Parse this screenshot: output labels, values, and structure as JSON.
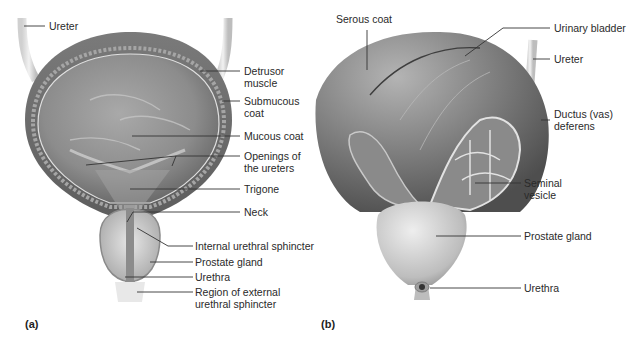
{
  "figure": {
    "panel_a": {
      "panel_label": "(a)",
      "labels": {
        "ureter": "Ureter",
        "detrusor_muscle": "Detrusor\nmuscle",
        "submucous_coat": "Submucous\ncoat",
        "mucous_coat": "Mucous coat",
        "openings_of_ureters": "Openings of\nthe ureters",
        "trigone": "Trigone",
        "neck": "Neck",
        "internal_urethral_sphincter": "Internal urethral sphincter",
        "prostate_gland": "Prostate gland",
        "urethra": "Urethra",
        "region_external_sphincter": "Region of external\nurethral sphincter"
      }
    },
    "panel_b": {
      "panel_label": "(b)",
      "labels": {
        "serous_coat": "Serous coat",
        "urinary_bladder": "Urinary bladder",
        "ureter": "Ureter",
        "ductus_deferens": "Ductus (vas)\ndeferens",
        "seminal_vesicle": "Seminal\nvesicle",
        "prostate_gland": "Prostate gland",
        "urethra": "Urethra"
      }
    },
    "colors": {
      "background": "#ffffff",
      "tissue_dark": "#6e6e6e",
      "tissue_mid": "#9a9a9a",
      "tissue_light": "#c8c8c8",
      "leader_line": "#333333"
    }
  }
}
